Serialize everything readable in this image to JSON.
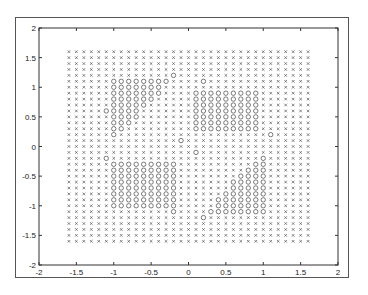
{
  "chart_data": {
    "type": "scatter",
    "title": "",
    "xlabel": "",
    "ylabel": "",
    "xlim": [
      -2,
      2
    ],
    "ylim": [
      -2,
      2
    ],
    "x_ticks": [
      "-2",
      "-1.5",
      "-1",
      "-0.5",
      "0",
      "0.5",
      "1",
      "1.5",
      "2"
    ],
    "y_ticks": [
      "2",
      "1.5",
      "1",
      "0.5",
      "0",
      "-0.5",
      "-1",
      "-1.5",
      "-2"
    ],
    "grid": false,
    "legend": null,
    "grid_points": {
      "x_min": -1.6,
      "x_max": 1.6,
      "y_min": -1.6,
      "y_max": 1.6,
      "step": 0.1
    },
    "series": [
      {
        "name": "class x",
        "marker": "x",
        "description": "all grid points outside circle regions"
      },
      {
        "name": "class o",
        "marker": "o",
        "description": "point-symmetric regions",
        "regions": [
          [
            [
              -1.05,
              1.15
            ],
            [
              -0.2,
              1.15
            ],
            [
              -0.6,
              0.6
            ],
            [
              -1.0,
              0.15
            ],
            [
              -1.1,
              0.6
            ]
          ],
          [
            [
              0.1,
              1.0
            ],
            [
              1.0,
              1.0
            ],
            [
              1.0,
              0.3
            ],
            [
              0.1,
              0.25
            ]
          ],
          [
            [
              -1.0,
              -0.25
            ],
            [
              -0.1,
              -0.3
            ],
            [
              -0.1,
              -1.0
            ],
            [
              -1.0,
              -1.0
            ]
          ],
          [
            [
              1.05,
              -1.15
            ],
            [
              0.2,
              -1.15
            ],
            [
              0.6,
              -0.6
            ],
            [
              1.0,
              -0.15
            ],
            [
              1.1,
              -0.6
            ]
          ]
        ],
        "strays": [
          [
            -0.2,
            1.2
          ],
          [
            0.15,
            1.2
          ],
          [
            -0.25,
            1.1
          ],
          [
            0.2,
            1.1
          ],
          [
            0.2,
            0.9
          ],
          [
            1.2,
            0.15
          ],
          [
            1.1,
            0.2
          ],
          [
            0.05,
            0.2
          ],
          [
            -0.1,
            0.1
          ],
          [
            0.2,
            -1.2
          ],
          [
            -0.15,
            -1.2
          ],
          [
            0.25,
            -1.1
          ],
          [
            -0.2,
            -1.1
          ],
          [
            -0.2,
            -0.9
          ],
          [
            -1.2,
            -0.15
          ],
          [
            -1.1,
            -0.2
          ],
          [
            -0.05,
            -0.2
          ],
          [
            0.1,
            -0.1
          ]
        ]
      }
    ]
  }
}
